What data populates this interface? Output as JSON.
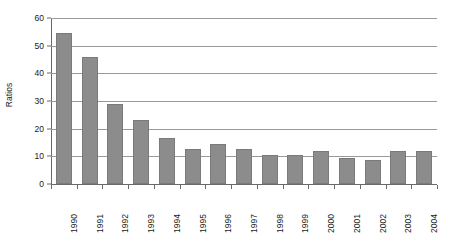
{
  "chart_data": {
    "type": "bar",
    "title": "",
    "subtitle": "",
    "xlabel": "",
    "ylabel": "Ratios",
    "categories": [
      "1990",
      "1991",
      "1992",
      "1993",
      "1994",
      "1995",
      "1996",
      "1997",
      "1998",
      "1999",
      "2000",
      "2001",
      "2002",
      "2003",
      "2004"
    ],
    "values": [
      54.5,
      46,
      29,
      23,
      16.5,
      12.5,
      14.5,
      12.5,
      10.5,
      10.5,
      12,
      9.5,
      8.5,
      12,
      12
    ],
    "series": [
      {
        "name": "Ratios",
        "values": [
          54.5,
          46,
          29,
          23,
          16.5,
          12.5,
          14.5,
          12.5,
          10.5,
          10.5,
          12,
          9.5,
          8.5,
          12,
          12
        ]
      }
    ],
    "ylim": [
      0,
      60
    ],
    "yticks": [
      0,
      10,
      20,
      30,
      40,
      50,
      60
    ],
    "ytick_labels": [
      "0",
      "10",
      "20",
      "30",
      "40",
      "50",
      "60"
    ],
    "grid": true,
    "grid_axis": "y",
    "legend": false,
    "legend_position": "none",
    "bar_color": "#8c8c8c",
    "bar_edge_color": "#7a7a7a",
    "gridline_color": "#9a9a9a",
    "axis_color": "#6a6a6a",
    "background_color": "#ffffff",
    "xtick_label_rotation": 90
  }
}
